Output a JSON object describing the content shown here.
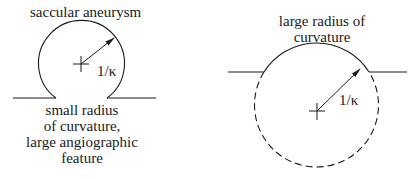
{
  "left_diagram": {
    "title": "saccular aneurysm",
    "radius_label": "1/κ",
    "caption_lines": [
      "small radius",
      "of curvature,",
      "large angiographic",
      "feature"
    ]
  },
  "right_diagram": {
    "title_lines": [
      "large radius of",
      "curvature"
    ],
    "radius_label": "1/κ"
  },
  "colors": {
    "stroke": "#1a1a1a",
    "background": "#ffffff"
  }
}
